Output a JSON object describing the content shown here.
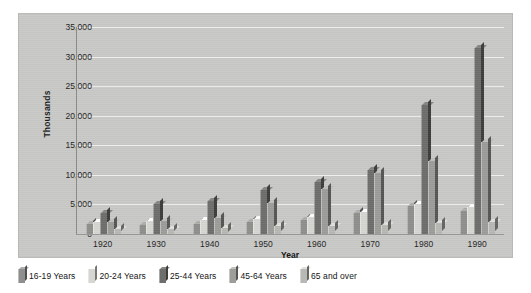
{
  "chart_data": {
    "type": "bar",
    "title": "",
    "xlabel": "Year",
    "ylabel": "Thousands",
    "categories": [
      "1920",
      "1930",
      "1940",
      "1950",
      "1960",
      "1970",
      "1980",
      "1990"
    ],
    "ylim": [
      0,
      35000
    ],
    "yticks": [
      "0",
      "5,000",
      "10,000",
      "15,000",
      "20,000",
      "25,000",
      "30,000",
      "35,000"
    ],
    "ytick_values": [
      0,
      5000,
      10000,
      15000,
      20000,
      25000,
      30000,
      35000
    ],
    "grid": true,
    "legend_position": "bottom",
    "series": [
      {
        "name": "16-19 Years",
        "values": [
          1700,
          1600,
          1700,
          2100,
          2400,
          3500,
          4700,
          3900
        ]
      },
      {
        "name": "20-24 Years",
        "values": [
          2100,
          2200,
          2400,
          2500,
          2800,
          3700,
          5000,
          4600
        ]
      },
      {
        "name": "25-44 Years",
        "values": [
          3500,
          5100,
          5500,
          7400,
          8800,
          10900,
          21800,
          31500
        ]
      },
      {
        "name": "45-64 Years",
        "values": [
          2000,
          2200,
          2700,
          5200,
          7600,
          10400,
          12400,
          15500
        ]
      },
      {
        "name": "65 and over",
        "values": [
          900,
          900,
          1100,
          1300,
          1400,
          1500,
          1800,
          2000
        ]
      }
    ],
    "colors": {
      "16-19 Years": "#8f8f8d",
      "20-24 Years": "#d6d6d2",
      "25-44 Years": "#6e6e6c",
      "45-64 Years": "#9d9d9a",
      "65 and over": "#b8b8b4",
      "panel_background": "#c9c9c7",
      "gridline": "#f2f2f0",
      "axis": "#8a8a88",
      "text": "#1f1f1f",
      "page_background": "#ffffff"
    }
  },
  "legend": {
    "items": [
      {
        "label": "16-19 Years"
      },
      {
        "label": "20-24 Years"
      },
      {
        "label": "25-44 Years"
      },
      {
        "label": "45-64 Years"
      },
      {
        "label": "65 and over"
      }
    ]
  }
}
